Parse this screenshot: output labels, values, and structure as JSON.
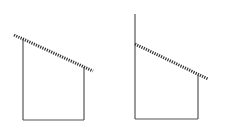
{
  "diagram": {
    "colors": {
      "stroke": "#555555",
      "hatch": "#333333",
      "background": "#ffffff"
    },
    "figures": [
      {
        "id": "left",
        "hatched_line": {
          "x1": 14,
          "y1": 35,
          "x2": 93,
          "y2": 71
        },
        "left_edge": {
          "x1": 23,
          "y1": 39,
          "x2": 23,
          "y2": 120
        },
        "right_edge": {
          "x1": 84,
          "y1": 67,
          "x2": 84,
          "y2": 120
        },
        "bottom_edge": {
          "x1": 23,
          "y1": 120,
          "x2": 84,
          "y2": 120
        }
      },
      {
        "id": "right",
        "hatched_line": {
          "x1": 135,
          "y1": 44,
          "x2": 208,
          "y2": 79
        },
        "left_edge": {
          "x1": 135,
          "y1": 14,
          "x2": 135,
          "y2": 119
        },
        "right_edge": {
          "x1": 198,
          "y1": 75,
          "x2": 198,
          "y2": 119
        },
        "bottom_edge": {
          "x1": 135,
          "y1": 119,
          "x2": 198,
          "y2": 119
        }
      }
    ]
  }
}
